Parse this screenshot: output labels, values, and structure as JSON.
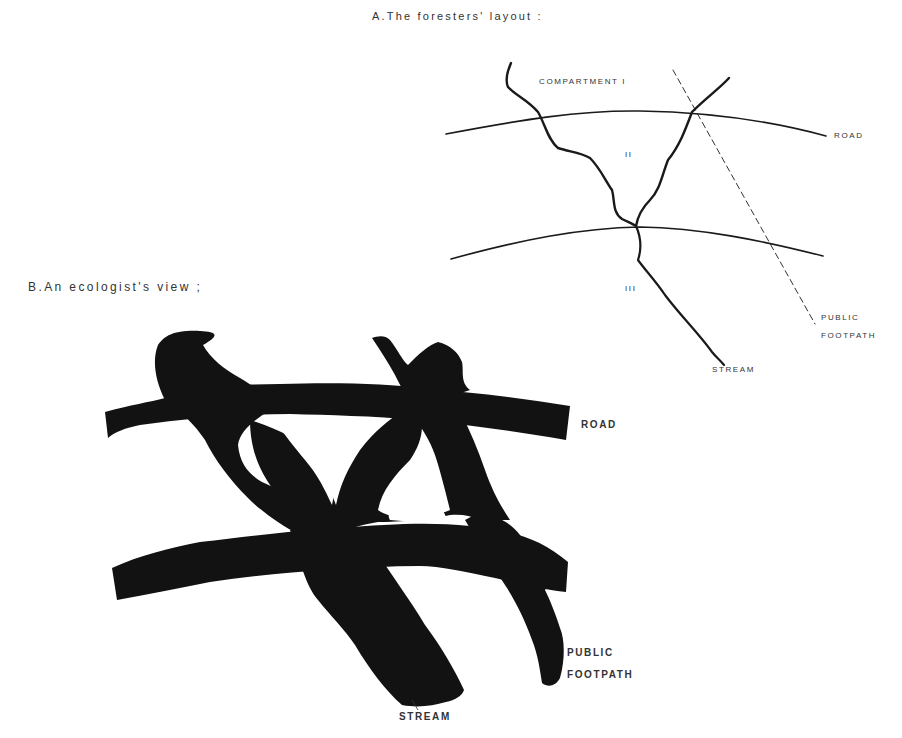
{
  "figure": {
    "panel_a": {
      "title": "A.The foresters' layout :",
      "labels": {
        "compartment_1": "COMPARTMENT I",
        "compartment_2": "II",
        "compartment_3": "III",
        "road": "ROAD",
        "footpath_line1": "PUBLIC",
        "footpath_line2": "FOOTPATH",
        "stream": "STREAM"
      }
    },
    "panel_b": {
      "title": "B.An ecologist's view ;",
      "labels": {
        "road": "ROAD",
        "footpath_line1": "PUBLIC",
        "footpath_line2": "FOOTPATH",
        "stream": "STREAM"
      }
    },
    "colors": {
      "ink": "#1a1a1a",
      "background": "#ffffff"
    }
  }
}
